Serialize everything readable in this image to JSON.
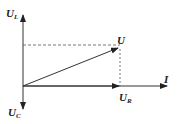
{
  "diagram": {
    "type": "phasor",
    "labels": {
      "ul": {
        "main": "U",
        "sub": "L"
      },
      "u": {
        "main": "U",
        "sub": ""
      },
      "ur": {
        "main": "U",
        "sub": "R"
      },
      "uc": {
        "main": "U",
        "sub": "C"
      },
      "i": {
        "main": "I",
        "sub": ""
      }
    },
    "colors": {
      "line": "#333333",
      "dash": "#555555"
    }
  }
}
